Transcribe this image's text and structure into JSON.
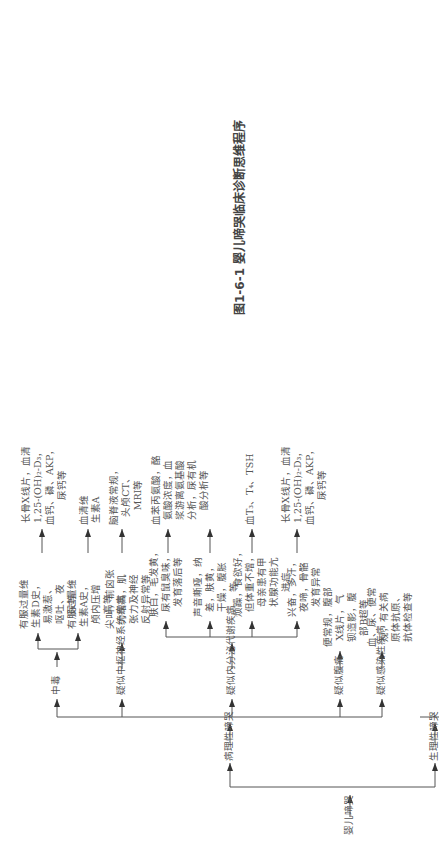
{
  "caption": "图1-6-1  婴儿啼哭临床诊断思维程序",
  "root": "婴儿啼哭",
  "branches": {
    "pathological": "病理性啼哭",
    "physiological": "生理性啼哭"
  },
  "pathological_categories": [
    {
      "label": "中毒"
    },
    {
      "label": "疑似中枢神经系统疾病"
    },
    {
      "label": "疑似内分泌代谢疾病"
    },
    {
      "label": "疑似腹痛"
    },
    {
      "label": "疑似感染性疾病"
    }
  ],
  "poisoning": {
    "symptoms": [
      "有服过量维\n生素D史，\n易激惹、\n呕吐、夜\n尿等",
      "有服过量维\n生素A史，\n颅内压增\n高等"
    ],
    "tests": [
      "长骨X线片，血清\n1,25-(OH)₂-D₃，\n血钙、磷、AKP，\n尿钙等",
      "血清维\n生素A"
    ]
  },
  "cns": {
    "symptoms": "尖叫，前囟张\n力增高，肌\n张力及神经\n反射异常等",
    "tests": "脑脊液常规，\n头颅CT、\nMRI等"
  },
  "endocrine": {
    "symptoms": [
      "肤白，毛发黄，\n尿有鼠臭味，\n发育落后等",
      "声音嘶哑，纳\n差，肤黄，\n干燥，腹胀\n等",
      "烦躁，食欲好，\n但体重不增，\n母亲患有甲\n状腺功能亢\n进症",
      "兴奋，多汗，\n夜啼，骨骼\n发育异常"
    ],
    "tests": [
      "血苯丙氨酸，酪\n氨酸浓度，血\n浆游离氨基酸\n分析，尿有机\n酸分析等",
      "",
      "血T₃、T₄、TSH",
      "长骨X线片，血清\n1,25-(OH)₂-D₃，\n血钙、磷、AKP，\n尿钙等"
    ]
  },
  "abdominal_pain": {
    "tests": "便常规，腹部\nX线片，气\n钡造影，腹\n部B超等"
  },
  "infection": {
    "tests": "血、尿、便常\n规，有关病\n原体抗原、\n抗体检查等"
  },
  "physiological_causes": [
    "冷、热、湿、痒",
    "饥饿感或喂养不当",
    "出牙",
    "生活规律紊乱",
    "鼻塞不适",
    "吵瞌睡",
    "排尿、排便感",
    "肠绞痛"
  ]
}
